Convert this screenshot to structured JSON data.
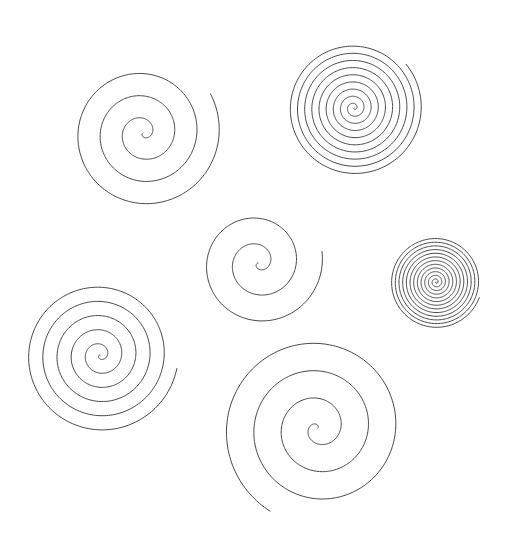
{
  "figure": {
    "type": "line-art-illustration",
    "background_color": "#ffffff",
    "stroke_color": "#333333",
    "stroke_width": 0.9,
    "canvas": {
      "width": 509,
      "height": 541
    },
    "shape_count": 6,
    "shape_kind": "archimedean-spiral"
  },
  "chart_data": {
    "type": "line",
    "subtitle": "",
    "xlabel": "",
    "ylabel": "",
    "grid": false,
    "legend_position": "none",
    "axis_visible": false,
    "xlim": [
      0,
      509
    ],
    "ylim": [
      0,
      541
    ],
    "series": [
      {
        "name": "spiral-top-left",
        "center_x": 143,
        "center_y": 133,
        "outer_radius": 78,
        "turns": 3.5,
        "start_angle_deg": 150,
        "end_angle_deg": 1410,
        "direction": "counterclockwise",
        "end_point_x": 104,
        "end_point_y": 213
      },
      {
        "name": "spiral-top-right",
        "center_x": 354,
        "center_y": 108,
        "outer_radius": 68,
        "turns": 9.5,
        "start_angle_deg": 140,
        "end_angle_deg": 3560,
        "direction": "counterclockwise",
        "end_point_x": 414,
        "end_point_y": 47
      },
      {
        "name": "spiral-middle",
        "center_x": 258,
        "center_y": 263,
        "outer_radius": 65,
        "turns": 2.5,
        "start_angle_deg": 170,
        "end_angle_deg": 1070,
        "direction": "counterclockwise",
        "end_point_x": 356,
        "end_point_y": 271
      },
      {
        "name": "spiral-small-right",
        "center_x": 436,
        "center_y": 282,
        "outer_radius": 46,
        "turns": 12.5,
        "start_angle_deg": 200,
        "end_angle_deg": 4700,
        "direction": "counterclockwise",
        "end_point_x": 394,
        "end_point_y": 264
      },
      {
        "name": "spiral-bottom-left",
        "center_x": 100,
        "center_y": 355,
        "outer_radius": 78,
        "turns": 5.5,
        "start_angle_deg": 190,
        "end_angle_deg": 2170,
        "direction": "counterclockwise",
        "end_point_x": 71,
        "end_point_y": 258
      },
      {
        "name": "spiral-bottom-center",
        "center_x": 318,
        "center_y": 428,
        "outer_radius": 96,
        "turns": 3.5,
        "start_angle_deg": 300,
        "end_angle_deg": 1560,
        "direction": "counterclockwise",
        "end_point_x": 390,
        "end_point_y": 515
      }
    ]
  }
}
